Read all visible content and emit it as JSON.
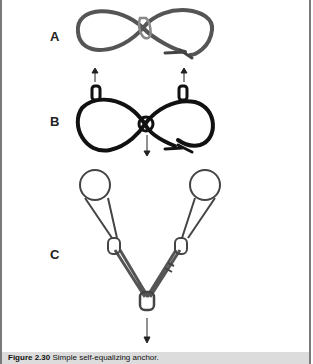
{
  "figure": {
    "panels": [
      {
        "label": "A",
        "description": "Sling tied in figure-eight loop through carabiner with water knot"
      },
      {
        "label": "B",
        "description": "Figure-eight sling clipped to two anchors with pull arrows"
      },
      {
        "label": "C",
        "description": "Two anchor slings joined at single carabiner, load arrow down"
      }
    ],
    "caption": {
      "number": "Figure 2.30",
      "text": "Simple self-equalizing anchor."
    }
  }
}
